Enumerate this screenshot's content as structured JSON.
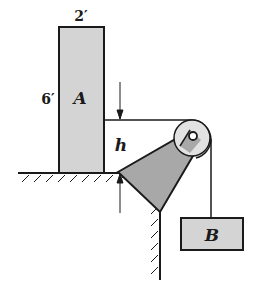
{
  "diagram": {
    "block_a": {
      "label": "A",
      "width_label": "2′",
      "height_label": "6′",
      "fill": "#d4d4d4"
    },
    "block_b": {
      "label": "B",
      "fill": "#d4d4d4"
    },
    "dimension": {
      "label": "h"
    },
    "bracket": {
      "fill": "#a8a8a8"
    },
    "pulley": {
      "fill": "#e2e2e2"
    },
    "line_color": "#1a1a1a"
  }
}
